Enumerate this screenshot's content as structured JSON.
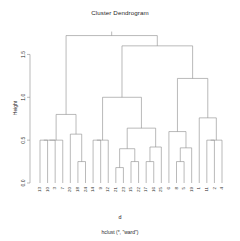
{
  "chart_data": {
    "type": "dendrogram",
    "title": "Cluster Dendrogram",
    "xlabel": "d",
    "ylabel": "Height",
    "subtitle": "hclust (*, \"ward\")",
    "method": "ward",
    "n_leaves": 25,
    "ylim": [
      0.0,
      1.75
    ],
    "grid": false,
    "legend": null,
    "yticks": [
      0.0,
      0.5,
      1.0,
      1.5
    ],
    "ytick_labels": [
      "0.0",
      "0.5",
      "1.0",
      "1.5"
    ],
    "leaf_order": [
      "13",
      "10",
      "3",
      "7",
      "20",
      "18",
      "24",
      "14",
      "9",
      "12",
      "21",
      "23",
      "15",
      "22",
      "17",
      "16",
      "25",
      "6",
      "8",
      "5",
      "19",
      "1",
      "11",
      "2",
      "4"
    ],
    "merges": [
      {
        "id": "m1",
        "left": "13",
        "right": "10",
        "height": 0.5
      },
      {
        "id": "m2",
        "left": "m1",
        "right": "3",
        "height": 0.5
      },
      {
        "id": "m3",
        "left": "m2",
        "right": "7",
        "height": 0.5
      },
      {
        "id": "m4",
        "left": "18",
        "right": "24",
        "height": 0.25
      },
      {
        "id": "m5",
        "left": "20",
        "right": "m4",
        "height": 0.57
      },
      {
        "id": "m6",
        "left": "m3",
        "right": "m5",
        "height": 0.8
      },
      {
        "id": "m7",
        "left": "14",
        "right": "9",
        "height": 0.5
      },
      {
        "id": "m8",
        "left": "m7",
        "right": "12",
        "height": 0.5
      },
      {
        "id": "m9",
        "left": "21",
        "right": "23",
        "height": 0.18
      },
      {
        "id": "m10",
        "left": "15",
        "right": "22",
        "height": 0.25
      },
      {
        "id": "m11",
        "left": "m9",
        "right": "m10",
        "height": 0.4
      },
      {
        "id": "m12",
        "left": "17",
        "right": "16",
        "height": 0.25
      },
      {
        "id": "m13",
        "left": "m12",
        "right": "25",
        "height": 0.42
      },
      {
        "id": "m14",
        "left": "m11",
        "right": "m13",
        "height": 0.64
      },
      {
        "id": "m15",
        "left": "m8",
        "right": "m14",
        "height": 1.0
      },
      {
        "id": "m16",
        "left": "8",
        "right": "5",
        "height": 0.25
      },
      {
        "id": "m17",
        "left": "m16",
        "right": "19",
        "height": 0.41
      },
      {
        "id": "m18",
        "left": "6",
        "right": "m17",
        "height": 0.6
      },
      {
        "id": "m19",
        "left": "11",
        "right": "2",
        "height": 0.5
      },
      {
        "id": "m20",
        "left": "m19",
        "right": "4",
        "height": 0.5
      },
      {
        "id": "m21",
        "left": "1",
        "right": "m20",
        "height": 0.76
      },
      {
        "id": "m22",
        "left": "m18",
        "right": "m21",
        "height": 1.22
      },
      {
        "id": "m23",
        "left": "m15",
        "right": "m22",
        "height": 1.6
      },
      {
        "id": "m24",
        "left": "m6",
        "right": "m23",
        "height": 1.72
      }
    ]
  },
  "style": {
    "line_color": "#8c8c8c",
    "axis_color": "#8c8c8c",
    "text_color": "#1f1f1f",
    "background": "#ffffff"
  }
}
